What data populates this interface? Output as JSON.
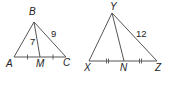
{
  "figure_left": {
    "vertices": {
      "B": {
        "label": "B",
        "x": 34,
        "y": 22
      },
      "A": {
        "label": "A",
        "x": 14,
        "y": 57
      },
      "C": {
        "label": "C",
        "x": 66,
        "y": 57
      },
      "M": {
        "label": "M",
        "x": 40,
        "y": 57
      }
    },
    "segment_labels": {
      "BM": "7",
      "BC": "9"
    },
    "tick_style": "single",
    "note": "AM ≅ MC"
  },
  "figure_right": {
    "vertices": {
      "Y": {
        "label": "Y",
        "x": 112,
        "y": 13
      },
      "X": {
        "label": "X",
        "x": 89,
        "y": 61
      },
      "Z": {
        "label": "Z",
        "x": 157,
        "y": 61
      },
      "N": {
        "label": "N",
        "x": 124,
        "y": 61
      }
    },
    "segment_labels": {
      "YZ": "12"
    },
    "tick_style": "double",
    "note": "XN ≅ NZ"
  },
  "colors": {
    "line": "#555555",
    "text": "#222222",
    "background": "#ffffff"
  }
}
